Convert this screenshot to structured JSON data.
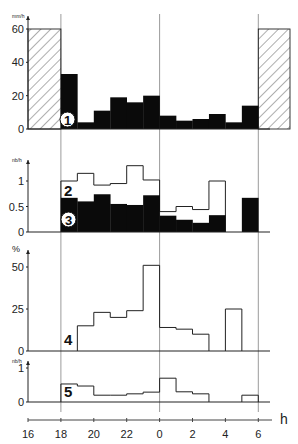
{
  "chart_data": {
    "type": "bar",
    "xlabel": "h",
    "x_ticks": [
      "16",
      "18",
      "20",
      "22",
      "0",
      "2",
      "4",
      "6"
    ],
    "x_tick_hours": [
      16,
      18,
      20,
      22,
      24,
      26,
      28,
      30
    ],
    "x_range_hours": [
      16,
      31
    ],
    "reference_lines_hours": [
      18,
      24,
      30
    ],
    "bins_hours": [
      18,
      19,
      20,
      21,
      22,
      23,
      24,
      25,
      26,
      27,
      28,
      29,
      30
    ],
    "panels": [
      {
        "id": "1",
        "ylabel": "mm/h",
        "ylim": [
          0,
          60
        ],
        "yticks": [
          "0",
          "20",
          "40",
          "60"
        ],
        "ytick_values": [
          0,
          20,
          40,
          60
        ],
        "series": [
          {
            "name": "1",
            "style": "filled-black",
            "values": [
              33,
              4,
              11,
              19,
              16,
              20,
              8,
              5,
              6,
              9,
              4,
              14
            ]
          },
          {
            "name": "hatched-before",
            "style": "hatched",
            "range_hours": [
              16,
              18
            ],
            "value": 60
          },
          {
            "name": "hatched-after",
            "style": "hatched",
            "range_hours": [
              30,
              32
            ],
            "value": 60
          }
        ]
      },
      {
        "id": "2-3",
        "ylabel": "nb/h",
        "ylim": [
          0,
          1.4
        ],
        "yticks": [
          "0",
          "0.5",
          "1"
        ],
        "ytick_values": [
          0,
          0.5,
          1
        ],
        "series": [
          {
            "name": "2",
            "style": "outline",
            "values": [
              1.0,
              1.15,
              0.92,
              0.95,
              1.3,
              1.02,
              0.4,
              0.5,
              0.44,
              1.0,
              0,
              0
            ]
          },
          {
            "name": "3",
            "style": "filled-black",
            "values": [
              0.67,
              0.6,
              0.74,
              0.55,
              0.53,
              0.72,
              0.32,
              0.24,
              0.18,
              0.33,
              0,
              0.67
            ]
          }
        ]
      },
      {
        "id": "4",
        "ylabel": "%",
        "ylim": [
          0,
          55
        ],
        "yticks": [
          "0",
          "25",
          "50"
        ],
        "ytick_values": [
          0,
          25,
          50
        ],
        "series": [
          {
            "name": "4",
            "style": "outline",
            "values": [
              0,
              15,
              23,
              20,
              24,
              51,
              14,
              13,
              10,
              0,
              25,
              0
            ]
          }
        ]
      },
      {
        "id": "5",
        "ylabel": "nb/h",
        "ylim": [
          0,
          1
        ],
        "yticks": [
          "0",
          "1"
        ],
        "ytick_values": [
          0,
          1
        ],
        "series": [
          {
            "name": "5",
            "style": "outline",
            "values": [
              0.53,
              0.47,
              0.2,
              0.2,
              0.24,
              0.29,
              0.7,
              0.3,
              0.24,
              0,
              0,
              0.2
            ]
          }
        ]
      }
    ]
  }
}
